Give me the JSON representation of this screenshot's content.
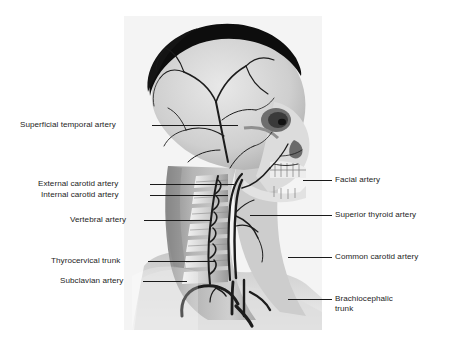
{
  "figure": {
    "panel": {
      "background_color": "#f4f4f4",
      "description": "Grayscale lateral-view medical illustration of the human head and neck showing the skull, cervical vertebrae, mandible with teeth, hair, and the major arteries of the head and neck."
    },
    "text_color": "#1d1d1d",
    "leader_color": "#1a1a1a",
    "labels_left": [
      {
        "id": "superficial-temporal-artery",
        "text": "Superficial temporal artery"
      },
      {
        "id": "external-carotid-artery",
        "text": "External carotid artery"
      },
      {
        "id": "internal-carotid-artery",
        "text": "Internal carotid artery"
      },
      {
        "id": "vertebral-artery",
        "text": "Vertebral artery"
      },
      {
        "id": "thyrocervical-trunk",
        "text": "Thyrocervical trunk"
      },
      {
        "id": "subclavian-artery",
        "text": "Subclavian artery"
      }
    ],
    "labels_right": [
      {
        "id": "facial-artery",
        "text": "Facial artery"
      },
      {
        "id": "superior-thyroid-artery",
        "text": "Superior thyroid artery"
      },
      {
        "id": "common-carotid-artery",
        "text": "Common carotid artery"
      },
      {
        "id": "brachiocephalic-trunk",
        "text": "Brachiocephalic trunk"
      }
    ]
  }
}
